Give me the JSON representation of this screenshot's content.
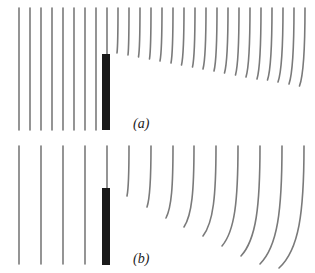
{
  "figure": {
    "line_color": "#7a7a7a",
    "barrier_color": "#1a1a1a"
  },
  "panels": [
    {
      "id": "a",
      "label": "(a)",
      "label_pos": {
        "x": 133,
        "y": 117
      },
      "barrier": {
        "x": 102,
        "y": 54,
        "width": 8,
        "height": 76
      },
      "wave_top": 8,
      "spacing": 11,
      "wavefronts": [
        {
          "x": 19,
          "y_end": 130,
          "curve": 0
        },
        {
          "x": 30,
          "y_end": 130,
          "curve": 0
        },
        {
          "x": 41,
          "y_end": 130,
          "curve": 0
        },
        {
          "x": 52,
          "y_end": 130,
          "curve": 0
        },
        {
          "x": 63,
          "y_end": 130,
          "curve": 0
        },
        {
          "x": 74,
          "y_end": 130,
          "curve": 0
        },
        {
          "x": 85,
          "y_end": 130,
          "curve": 0
        },
        {
          "x": 96,
          "y_end": 130,
          "curve": 0
        },
        {
          "x": 107,
          "y_end": 54,
          "curve": 0
        },
        {
          "x": 118,
          "y_end": 53,
          "curve": 1
        },
        {
          "x": 129,
          "y_end": 55,
          "curve": 1
        },
        {
          "x": 140,
          "y_end": 57,
          "curve": 1.5
        },
        {
          "x": 151,
          "y_end": 59,
          "curve": 1.5
        },
        {
          "x": 162,
          "y_end": 61,
          "curve": 2
        },
        {
          "x": 173,
          "y_end": 63,
          "curve": 2
        },
        {
          "x": 184,
          "y_end": 65,
          "curve": 2.5
        },
        {
          "x": 195,
          "y_end": 67,
          "curve": 2.5
        },
        {
          "x": 206,
          "y_end": 69,
          "curve": 3
        },
        {
          "x": 217,
          "y_end": 71,
          "curve": 3
        },
        {
          "x": 228,
          "y_end": 73,
          "curve": 3.5
        },
        {
          "x": 239,
          "y_end": 75,
          "curve": 3.5
        },
        {
          "x": 250,
          "y_end": 77,
          "curve": 4
        },
        {
          "x": 261,
          "y_end": 79,
          "curve": 4
        },
        {
          "x": 272,
          "y_end": 80,
          "curve": 4.5
        },
        {
          "x": 283,
          "y_end": 82,
          "curve": 5
        },
        {
          "x": 294,
          "y_end": 84,
          "curve": 5
        },
        {
          "x": 305,
          "y_end": 86,
          "curve": 5.5
        }
      ]
    },
    {
      "id": "b",
      "label": "(b)",
      "label_pos": {
        "x": 133,
        "y": 252
      },
      "barrier": {
        "x": 102,
        "y": 188,
        "width": 8,
        "height": 77
      },
      "wave_top": 146,
      "spacing": 22,
      "wavefronts": [
        {
          "x": 19,
          "y_end": 264,
          "curve": 0
        },
        {
          "x": 41,
          "y_end": 264,
          "curve": 0
        },
        {
          "x": 63,
          "y_end": 264,
          "curve": 0
        },
        {
          "x": 85,
          "y_end": 264,
          "curve": 0
        },
        {
          "x": 107,
          "y_end": 188,
          "curve": 0
        },
        {
          "x": 129,
          "y_end": 196,
          "curve": 2
        },
        {
          "x": 151,
          "y_end": 207,
          "curve": 4
        },
        {
          "x": 173,
          "y_end": 218,
          "curve": 7
        },
        {
          "x": 194,
          "y_end": 227,
          "curve": 10
        },
        {
          "x": 216,
          "y_end": 236,
          "curve": 13
        },
        {
          "x": 238,
          "y_end": 246,
          "curve": 16
        },
        {
          "x": 260,
          "y_end": 256,
          "curve": 19
        },
        {
          "x": 282,
          "y_end": 264,
          "curve": 22
        },
        {
          "x": 304,
          "y_end": 268,
          "curve": 25
        }
      ]
    }
  ]
}
